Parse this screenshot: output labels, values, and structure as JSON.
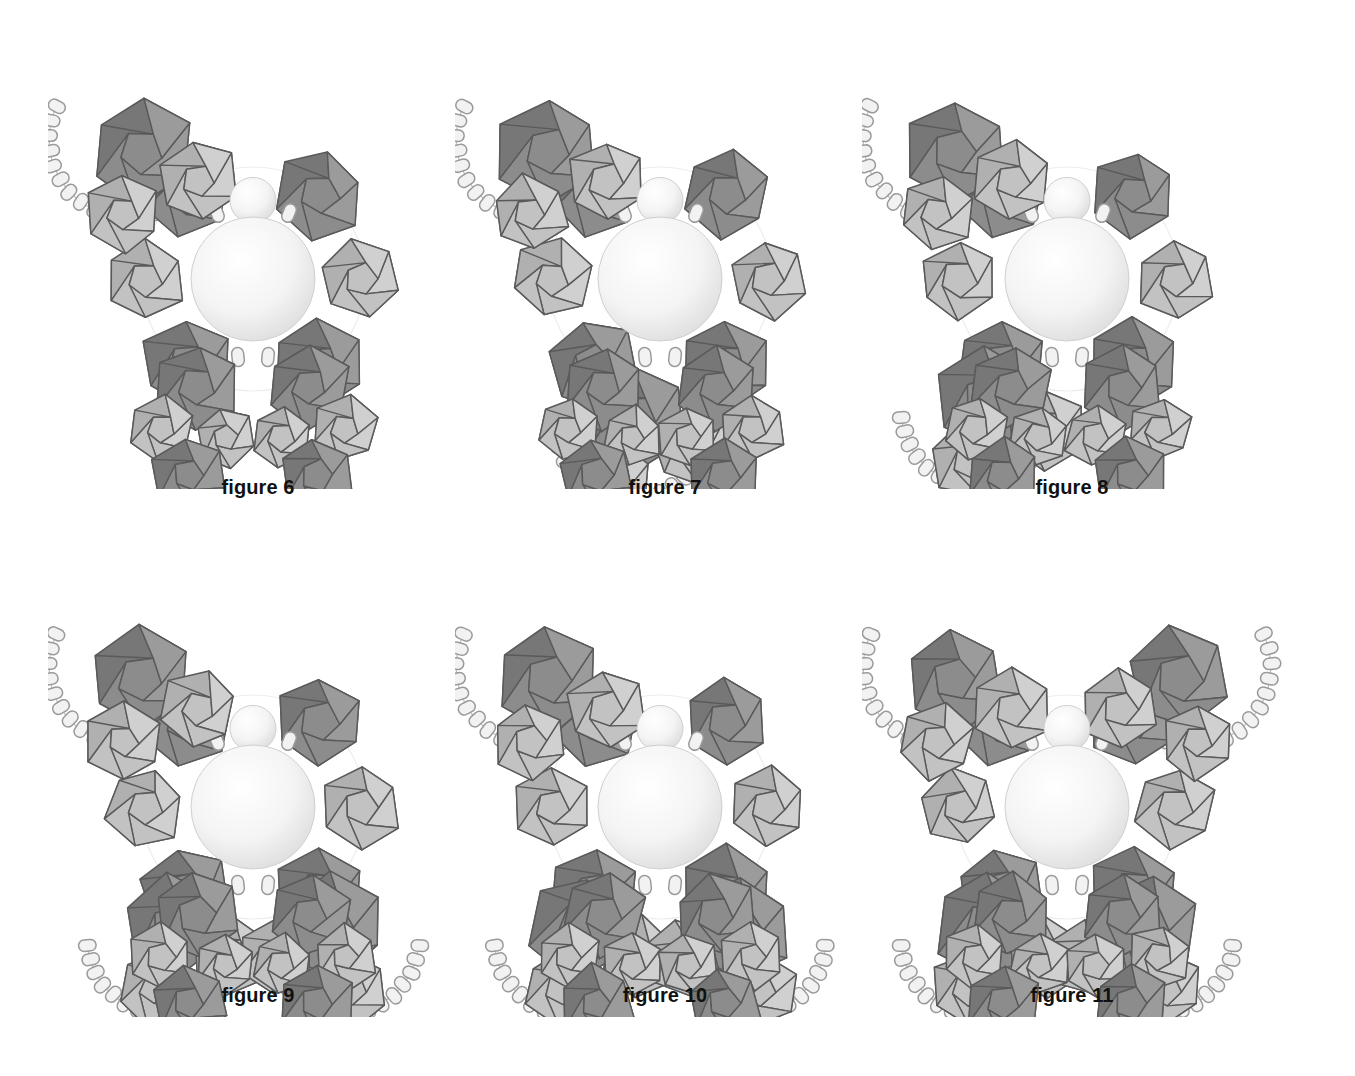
{
  "page": {
    "background_color": "#ffffff",
    "width": 1355,
    "height": 1076,
    "kind": "patent-style line art plate"
  },
  "palette": {
    "dark_polyhedron_fill": "#8c8c8c",
    "dark_polyhedron_fill_shaded": "#777777",
    "dark_polyhedron_fill_light": "#9b9b9b",
    "light_polyhedron_fill": "#c2c2c2",
    "light_polyhedron_fill_shaded": "#b0b0b0",
    "light_polyhedron_fill_light": "#d0d0d0",
    "outline": "#5a5a5a",
    "tile_fill": "#f2f2f2",
    "tile_outline": "#9a9a9a",
    "sphere_highlight": "#ffffff",
    "sphere_edge": "#d8d8d8",
    "sphere_outline": "#cfcfcf",
    "link_line": "#bdbdbd",
    "caption_color": "#111111"
  },
  "legend_note": "Each figure shows one large central sphere (body) with a small sphere (head), ringed by dodecahedral units in two grey tones, plus arcs of small rounded-rectangle tiles.",
  "figures": [
    {
      "id": "figure-6",
      "caption": "figure 6",
      "row": 1,
      "column": 1,
      "arc_count": 1,
      "arc_positions": [
        "upper-left"
      ],
      "dark_polyhedra": 7,
      "light_polyhedra": 7,
      "tiles": 20,
      "spheres": 2,
      "symmetry": "asymmetric"
    },
    {
      "id": "figure-7",
      "caption": "figure 7",
      "row": 1,
      "column": 2,
      "arc_count": 2,
      "arc_positions": [
        "upper-left",
        "lower-center"
      ],
      "dark_polyhedra": 7,
      "light_polyhedra": 7,
      "tiles": 36,
      "spheres": 2,
      "symmetry": "asymmetric"
    },
    {
      "id": "figure-8",
      "caption": "figure 8",
      "row": 1,
      "column": 3,
      "arc_count": 2,
      "arc_positions": [
        "upper-left",
        "lower-left"
      ],
      "dark_polyhedra": 8,
      "light_polyhedra": 8,
      "tiles": 34,
      "spheres": 2,
      "symmetry": "asymmetric"
    },
    {
      "id": "figure-9",
      "caption": "figure 9",
      "row": 2,
      "column": 1,
      "arc_count": 3,
      "arc_positions": [
        "upper-left",
        "lower-left",
        "lower-right"
      ],
      "dark_polyhedra": 8,
      "light_polyhedra": 8,
      "tiles": 48,
      "spheres": 2,
      "symmetry": "asymmetric"
    },
    {
      "id": "figure-10",
      "caption": "figure 10",
      "row": 2,
      "column": 2,
      "arc_count": 3,
      "arc_positions": [
        "upper-left",
        "lower-left",
        "lower-right"
      ],
      "dark_polyhedra": 9,
      "light_polyhedra": 9,
      "tiles": 50,
      "spheres": 2,
      "symmetry": "near-bilateral"
    },
    {
      "id": "figure-11",
      "caption": "figure 11",
      "row": 2,
      "column": 3,
      "arc_count": 4,
      "arc_positions": [
        "upper-left",
        "upper-right",
        "lower-left",
        "lower-right"
      ],
      "dark_polyhedra": 9,
      "light_polyhedra": 9,
      "tiles": 66,
      "spheres": 2,
      "symmetry": "bilateral"
    }
  ]
}
